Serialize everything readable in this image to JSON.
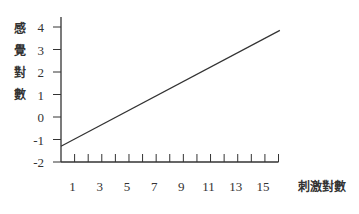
{
  "chart_data": {
    "type": "line",
    "title": "",
    "xlabel": "刺激對數",
    "ylabel": "感覺對數",
    "ylabel_chars": [
      "感",
      "覺",
      "對",
      "數"
    ],
    "xlim": [
      0,
      16
    ],
    "ylim": [
      -2,
      4
    ],
    "x_ticks": [
      1,
      3,
      5,
      7,
      9,
      11,
      13,
      15
    ],
    "x_minor_ticks": [
      1,
      2,
      3,
      4,
      5,
      6,
      7,
      8,
      9,
      10,
      11,
      12,
      13,
      14,
      15,
      16
    ],
    "y_ticks": [
      4,
      3,
      2,
      1,
      0,
      -1,
      -2
    ],
    "grid": false,
    "legend": null,
    "series": [
      {
        "name": "sensation-vs-stimulus",
        "x": [
          0,
          16.1
        ],
        "y": [
          -1.3,
          3.85
        ],
        "color": "#333333"
      }
    ]
  }
}
